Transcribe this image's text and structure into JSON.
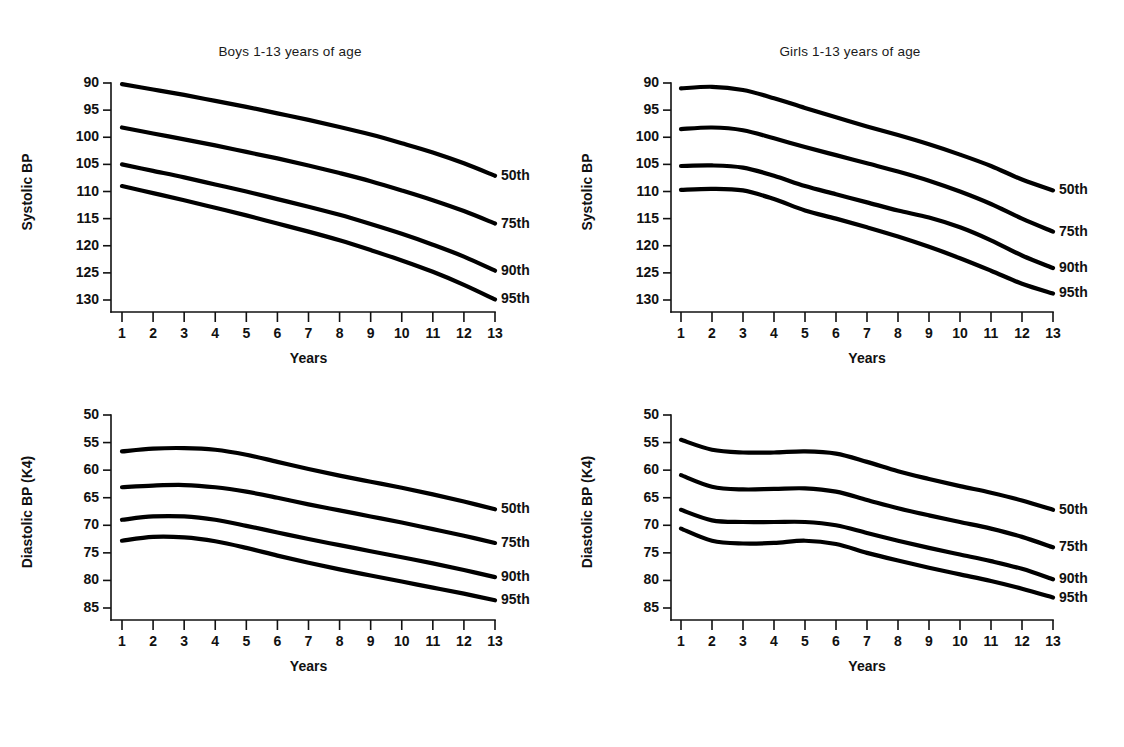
{
  "figure": {
    "background": "#ffffff",
    "ink_color": "#000000",
    "panel_count": 4
  },
  "chart_data": [
    {
      "id": "boys-systolic",
      "type": "line",
      "title": "Boys 1-13 years of age",
      "xlabel": "Years",
      "ylabel": "Systolic BP",
      "xlim": [
        1,
        13
      ],
      "ylim": [
        88,
        130
      ],
      "yticks": [
        90,
        95,
        100,
        105,
        110,
        115,
        120,
        125,
        130
      ],
      "xticks": [
        1,
        2,
        3,
        4,
        5,
        6,
        7,
        8,
        9,
        10,
        11,
        12,
        13
      ],
      "grid": false,
      "legend_position": "right-of-curve-ends",
      "x": [
        1,
        2,
        3,
        4,
        5,
        6,
        7,
        8,
        9,
        10,
        11,
        12,
        13
      ],
      "series": [
        {
          "name": "95th",
          "values": [
            109.0,
            110.3,
            111.6,
            113.0,
            114.4,
            115.9,
            117.4,
            119.0,
            120.8,
            122.7,
            124.8,
            127.2,
            129.9
          ]
        },
        {
          "name": "90th",
          "values": [
            105.0,
            106.2,
            107.4,
            108.7,
            110.0,
            111.4,
            112.8,
            114.3,
            116.0,
            117.8,
            119.8,
            122.0,
            124.6
          ]
        },
        {
          "name": "75th",
          "values": [
            98.2,
            99.3,
            100.4,
            101.5,
            102.7,
            103.9,
            105.2,
            106.6,
            108.1,
            109.8,
            111.6,
            113.6,
            115.9
          ]
        },
        {
          "name": "50th",
          "values": [
            90.2,
            91.2,
            92.2,
            93.3,
            94.4,
            95.6,
            96.8,
            98.1,
            99.5,
            101.1,
            102.8,
            104.8,
            107.1
          ]
        }
      ]
    },
    {
      "id": "girls-systolic",
      "type": "line",
      "title": "Girls 1-13 years of age",
      "xlabel": "Years",
      "ylabel": "Systolic BP",
      "xlim": [
        1,
        13
      ],
      "ylim": [
        88,
        130
      ],
      "yticks": [
        90,
        95,
        100,
        105,
        110,
        115,
        120,
        125,
        130
      ],
      "xticks": [
        1,
        2,
        3,
        4,
        5,
        6,
        7,
        8,
        9,
        10,
        11,
        12,
        13
      ],
      "grid": false,
      "legend_position": "right-of-curve-ends",
      "x": [
        1,
        2,
        3,
        4,
        5,
        6,
        7,
        8,
        9,
        10,
        11,
        12,
        13
      ],
      "series": [
        {
          "name": "95th",
          "values": [
            109.7,
            109.5,
            109.8,
            111.4,
            113.5,
            115.0,
            116.6,
            118.3,
            120.2,
            122.3,
            124.6,
            127.0,
            128.8
          ]
        },
        {
          "name": "90th",
          "values": [
            105.3,
            105.2,
            105.6,
            107.1,
            109.0,
            110.5,
            112.0,
            113.5,
            114.8,
            116.6,
            119.0,
            121.8,
            124.1
          ]
        },
        {
          "name": "75th",
          "values": [
            98.5,
            98.2,
            98.7,
            100.2,
            101.8,
            103.3,
            104.8,
            106.3,
            108.0,
            110.0,
            112.3,
            115.0,
            117.4
          ]
        },
        {
          "name": "50th",
          "values": [
            91.0,
            90.7,
            91.3,
            92.8,
            94.6,
            96.3,
            98.0,
            99.6,
            101.3,
            103.2,
            105.3,
            107.8,
            109.8
          ]
        }
      ]
    },
    {
      "id": "boys-diastolic",
      "type": "line",
      "title": "",
      "xlabel": "Years",
      "ylabel": "Diastolic BP (K4)",
      "xlim": [
        1,
        13
      ],
      "ylim": [
        48,
        85
      ],
      "yticks": [
        50,
        55,
        60,
        65,
        70,
        75,
        80,
        85
      ],
      "xticks": [
        1,
        2,
        3,
        4,
        5,
        6,
        7,
        8,
        9,
        10,
        11,
        12,
        13
      ],
      "grid": false,
      "legend_position": "right-of-curve-ends",
      "x": [
        1,
        2,
        3,
        4,
        5,
        6,
        7,
        8,
        9,
        10,
        11,
        12,
        13
      ],
      "series": [
        {
          "name": "95th",
          "values": [
            72.8,
            72.1,
            72.2,
            72.9,
            74.1,
            75.5,
            76.8,
            78.0,
            79.1,
            80.2,
            81.3,
            82.4,
            83.6
          ]
        },
        {
          "name": "90th",
          "values": [
            69.0,
            68.4,
            68.4,
            69.0,
            70.1,
            71.3,
            72.5,
            73.6,
            74.7,
            75.8,
            76.9,
            78.1,
            79.4
          ]
        },
        {
          "name": "75th",
          "values": [
            63.1,
            62.8,
            62.7,
            63.1,
            63.9,
            65.0,
            66.2,
            67.3,
            68.4,
            69.5,
            70.7,
            71.9,
            73.2
          ]
        },
        {
          "name": "50th",
          "values": [
            56.6,
            56.1,
            56.0,
            56.3,
            57.2,
            58.5,
            59.8,
            61.0,
            62.1,
            63.2,
            64.4,
            65.7,
            67.1
          ]
        }
      ]
    },
    {
      "id": "girls-diastolic",
      "type": "line",
      "title": "",
      "xlabel": "Years",
      "ylabel": "Diastolic BP (K4)",
      "xlim": [
        1,
        13
      ],
      "ylim": [
        48,
        85
      ],
      "yticks": [
        50,
        55,
        60,
        65,
        70,
        75,
        80,
        85
      ],
      "xticks": [
        1,
        2,
        3,
        4,
        5,
        6,
        7,
        8,
        9,
        10,
        11,
        12,
        13
      ],
      "grid": false,
      "legend_position": "right-of-curve-ends",
      "x": [
        1,
        2,
        3,
        4,
        5,
        6,
        7,
        8,
        9,
        10,
        11,
        12,
        13
      ],
      "series": [
        {
          "name": "95th",
          "values": [
            70.6,
            72.8,
            73.3,
            73.2,
            72.8,
            73.4,
            75.0,
            76.4,
            77.7,
            78.9,
            80.1,
            81.5,
            83.1
          ]
        },
        {
          "name": "90th",
          "values": [
            67.2,
            69.1,
            69.4,
            69.4,
            69.4,
            70.0,
            71.4,
            72.8,
            74.1,
            75.3,
            76.5,
            77.9,
            79.8
          ]
        },
        {
          "name": "75th",
          "values": [
            60.9,
            63.0,
            63.5,
            63.4,
            63.3,
            63.9,
            65.4,
            66.9,
            68.2,
            69.4,
            70.6,
            72.1,
            74.0
          ]
        },
        {
          "name": "50th",
          "values": [
            54.5,
            56.3,
            56.8,
            56.8,
            56.6,
            57.0,
            58.5,
            60.2,
            61.6,
            62.9,
            64.1,
            65.5,
            67.2
          ]
        }
      ]
    }
  ],
  "panels": [
    {
      "key": "boys-systolic",
      "title": "Boys 1-13 years of age",
      "ylabel": "Systolic BP",
      "xlabel": "Years",
      "yticks": [
        "130",
        "125",
        "120",
        "115",
        "110",
        "105",
        "100",
        "95",
        "90"
      ],
      "xticks": [
        "1",
        "2",
        "3",
        "4",
        "5",
        "6",
        "7",
        "8",
        "9",
        "10",
        "11",
        "12",
        "13"
      ],
      "series_labels": [
        "95th",
        "90th",
        "75th",
        "50th"
      ]
    },
    {
      "key": "girls-systolic",
      "title": "Girls 1-13 years of age",
      "ylabel": "Systolic BP",
      "xlabel": "Years",
      "yticks": [
        "130",
        "125",
        "120",
        "115",
        "110",
        "105",
        "100",
        "95",
        "90"
      ],
      "xticks": [
        "1",
        "2",
        "3",
        "4",
        "5",
        "6",
        "7",
        "8",
        "9",
        "10",
        "11",
        "12",
        "13"
      ],
      "series_labels": [
        "95th",
        "90th",
        "75th",
        "50th"
      ]
    },
    {
      "key": "boys-diastolic",
      "title": "",
      "ylabel": "Diastolic BP (K4)",
      "xlabel": "Years",
      "yticks": [
        "85",
        "80",
        "75",
        "70",
        "65",
        "60",
        "55",
        "50"
      ],
      "xticks": [
        "1",
        "2",
        "3",
        "4",
        "5",
        "6",
        "7",
        "8",
        "9",
        "10",
        "11",
        "12",
        "13"
      ],
      "series_labels": [
        "95th",
        "90th",
        "75th",
        "50th"
      ]
    },
    {
      "key": "girls-diastolic",
      "title": "",
      "ylabel": "Diastolic BP (K4)",
      "xlabel": "Years",
      "yticks": [
        "85",
        "80",
        "75",
        "70",
        "65",
        "60",
        "55",
        "50"
      ],
      "xticks": [
        "1",
        "2",
        "3",
        "4",
        "5",
        "6",
        "7",
        "8",
        "9",
        "10",
        "11",
        "12",
        "13"
      ],
      "series_labels": [
        "95th",
        "90th",
        "75th",
        "50th"
      ]
    }
  ]
}
